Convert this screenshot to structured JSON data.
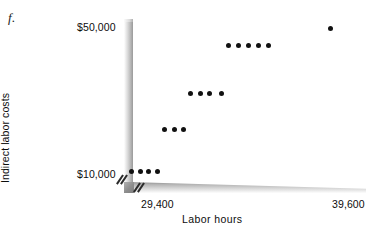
{
  "figure": {
    "label": "f."
  },
  "axes": {
    "y_title": "Indirect labor costs",
    "x_title": "Labor hours",
    "y_tick_top": "$50,000",
    "y_tick_bottom": "$10,000",
    "x_tick_left": "29,400",
    "x_tick_right": "39,600"
  },
  "chart_data": {
    "type": "scatter",
    "title": "",
    "xlabel": "Labor hours",
    "ylabel": "Indirect labor costs",
    "xlim": [
      29400,
      39600
    ],
    "ylim": [
      10000,
      50000
    ],
    "xticks": [
      29400,
      39600
    ],
    "xticklabels": [
      "29,400",
      "39,600"
    ],
    "yticks": [
      10000,
      50000
    ],
    "yticklabels": [
      "$10,000",
      "$50,000"
    ],
    "grid": false,
    "legend": null,
    "axis_break_x": true,
    "axis_break_y": true,
    "point_color": "#111111",
    "axis_color": "#9a9a9a",
    "n_points": 17,
    "x": [
      29650,
      30050,
      30450,
      30900,
      31750,
      32200,
      32600,
      33400,
      33850,
      34300,
      34800,
      35450,
      35900,
      36350,
      36800,
      37250,
      39100
    ],
    "y": [
      11300,
      11300,
      11300,
      11300,
      19800,
      19800,
      19800,
      27200,
      27200,
      27200,
      27200,
      35600,
      35600,
      35600,
      35600,
      35600,
      47400
    ],
    "clusters": [
      {
        "count": 4,
        "y_value": 11300,
        "x_start": 29650,
        "x_end": 30900
      },
      {
        "count": 3,
        "y_value": 19800,
        "x_start": 31750,
        "x_end": 32600
      },
      {
        "count": 4,
        "y_value": 27200,
        "x_start": 33400,
        "x_end": 34800
      },
      {
        "count": 5,
        "y_value": 35600,
        "x_start": 35450,
        "x_end": 37250
      },
      {
        "count": 1,
        "y_value": 47400,
        "x_start": 39100,
        "x_end": 39100
      }
    ],
    "pixel_points": [
      [
        131,
        171
      ],
      [
        140,
        171
      ],
      [
        148,
        171
      ],
      [
        157,
        171
      ],
      [
        164,
        129
      ],
      [
        174,
        129
      ],
      [
        183,
        129
      ],
      [
        190,
        93
      ],
      [
        200,
        93
      ],
      [
        209,
        93
      ],
      [
        221,
        93
      ],
      [
        228,
        45
      ],
      [
        238,
        45
      ],
      [
        248,
        45
      ],
      [
        258,
        45
      ],
      [
        268,
        45
      ],
      [
        330,
        28
      ]
    ]
  }
}
